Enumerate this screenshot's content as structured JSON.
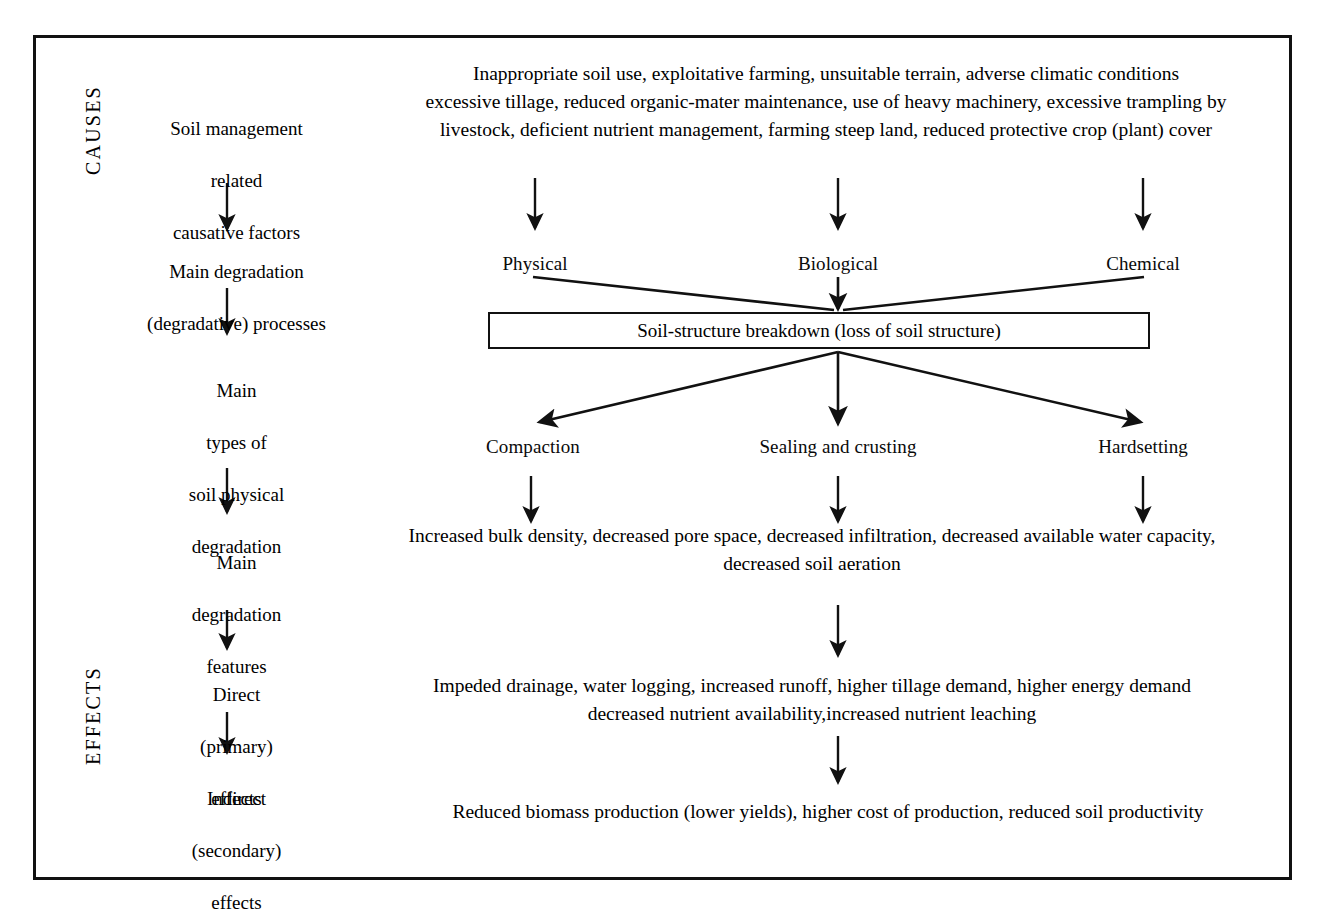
{
  "figure": {
    "domain": "diagram",
    "style": {
      "ink": "#111111",
      "paper": "#ffffff"
    }
  },
  "side_labels": {
    "causes": "CAUSES",
    "effects": "EFFECTS"
  },
  "left_column": {
    "stages": [
      {
        "id": "causative-factors",
        "lines": [
          "Soil management",
          "related",
          "causative factors"
        ]
      },
      {
        "id": "degradation-processes",
        "lines": [
          "Main degradation",
          "(degradative) processes"
        ]
      },
      {
        "id": "degradation-types",
        "lines": [
          "Main",
          "types of",
          "soil physical",
          "degradation"
        ]
      },
      {
        "id": "degradation-features",
        "lines": [
          "Main",
          "degradation",
          "features"
        ]
      },
      {
        "id": "direct-effects",
        "lines": [
          "Direct",
          "(primary)",
          "effects"
        ]
      },
      {
        "id": "indirect-effects",
        "lines": [
          "Indirect",
          "(secondary)",
          "effects"
        ]
      }
    ]
  },
  "right_column": {
    "causes_block": {
      "lines": [
        "Inappropriate soil use, exploitative farming, unsuitable terrain, adverse climatic conditions",
        "excessive tillage, reduced organic-mater maintenance, use of heavy machinery, excessive trampling by",
        "livestock, deficient nutrient management, farming steep land, reduced protective crop (plant) cover"
      ]
    },
    "process_labels": [
      {
        "id": "physical",
        "label": "Physical"
      },
      {
        "id": "biological",
        "label": "Biological"
      },
      {
        "id": "chemical",
        "label": "Chemical"
      }
    ],
    "breakdown_box": {
      "label": "Soil-structure breakdown (loss of soil structure)"
    },
    "degradation_types": [
      {
        "id": "compaction",
        "label": "Compaction"
      },
      {
        "id": "sealing-and-crusting",
        "label": "Sealing and crusting"
      },
      {
        "id": "hardsetting",
        "label": "Hardsetting"
      }
    ],
    "features_block": {
      "lines": [
        "Increased bulk density, decreased pore space, decreased infiltration, decreased available water capacity,",
        "decreased soil aeration"
      ]
    },
    "primary_effects_block": {
      "lines": [
        "Impeded drainage, water logging, increased runoff, higher tillage demand, higher energy demand",
        "decreased nutrient availability,increased nutrient leaching"
      ]
    },
    "secondary_effects_block": {
      "lines": [
        "Reduced biomass production (lower yields), higher cost of production, reduced soil productivity"
      ]
    }
  }
}
